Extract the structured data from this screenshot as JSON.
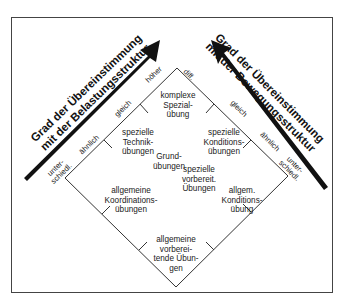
{
  "arrows": {
    "left": {
      "line1": "Grad der Übereinstimmung",
      "line2": "mit der Belastungsstruktur"
    },
    "right": {
      "line1": "Grad der Übereinstimmung",
      "line2": "mit der Bewegungsstruktur"
    }
  },
  "edge_labels": {
    "left": {
      "top": "höher",
      "gleich": "gleich",
      "aehnlich": "ähnlich",
      "unter1": "unter-",
      "unter2": "schiedl."
    },
    "right": {
      "top": "diff.",
      "gleich": "gleich",
      "aehnlich": "ähnlich",
      "unter1": "unter-",
      "unter2": "schiedl."
    }
  },
  "cells": {
    "komplexe": [
      "komplexe",
      "Spezial-",
      "übung"
    ],
    "technik": [
      "spezielle",
      "Technik-",
      "übungen"
    ],
    "konditions": [
      "spezielle",
      "Konditions-",
      "übungen"
    ],
    "grund": [
      "Grund-",
      "übungen"
    ],
    "vorbereit": [
      "spezielle",
      "vorbereit.",
      "Übungen"
    ],
    "koordination": [
      "allgemeine",
      "Koordinations-",
      "übungen"
    ],
    "allgkondition": [
      "allgem.",
      "Konditions-",
      "übung"
    ],
    "allgvorbereit": [
      "allgemeine",
      "vorberei-",
      "tende Übun-",
      "gen"
    ]
  }
}
